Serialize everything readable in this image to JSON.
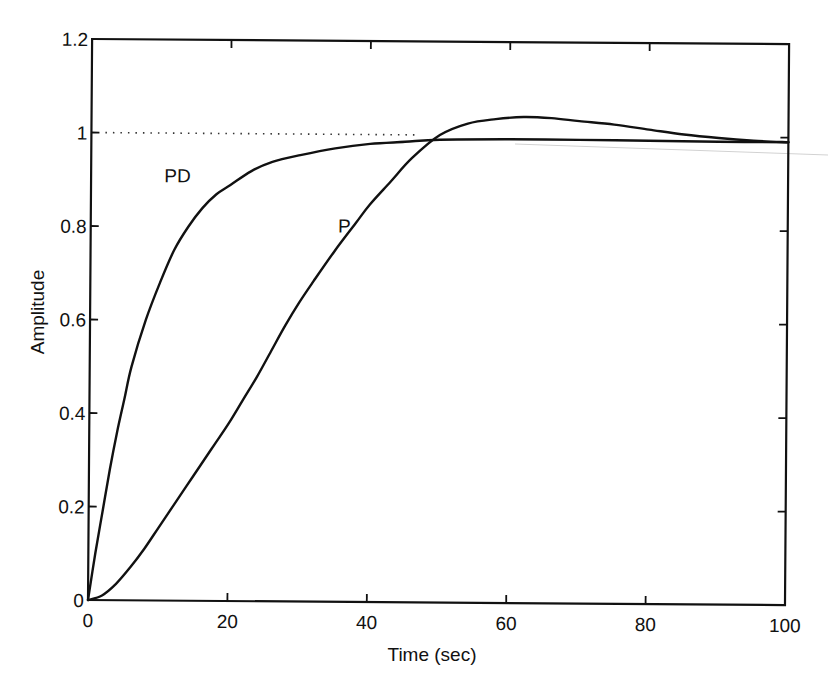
{
  "chart_data": {
    "type": "line",
    "title": "",
    "xlabel": "Time (sec)",
    "ylabel": "Amplitude",
    "xlim": [
      0,
      100
    ],
    "ylim": [
      0,
      1.2
    ],
    "xticks": [
      0,
      20,
      40,
      60,
      80,
      100
    ],
    "xtick_labels": [
      "0",
      "20",
      "40",
      "60",
      "80",
      "100"
    ],
    "yticks": [
      0,
      0.2,
      0.4,
      0.6,
      0.8,
      1,
      1.2
    ],
    "ytick_labels": [
      "0",
      "0.2",
      "0.4",
      "0.6",
      "0.8",
      "1",
      "1.2"
    ],
    "grid": false,
    "legend": null,
    "reference_line": {
      "y": 1.0,
      "style": "dotted",
      "x_range": [
        0,
        47
      ]
    },
    "annotations": [
      {
        "text": "PD",
        "x": 10.5,
        "y": 0.895
      },
      {
        "text": "P",
        "x": 35.5,
        "y": 0.79
      }
    ],
    "series": [
      {
        "name": "PD",
        "x": [
          0,
          1,
          2,
          3,
          4,
          5,
          6,
          8,
          10,
          12,
          14,
          16,
          18,
          20,
          23,
          26,
          30,
          35,
          40,
          45,
          50,
          60,
          70,
          80,
          90,
          100
        ],
        "y": [
          0,
          0.1,
          0.19,
          0.28,
          0.36,
          0.43,
          0.5,
          0.6,
          0.68,
          0.75,
          0.8,
          0.84,
          0.87,
          0.89,
          0.92,
          0.94,
          0.955,
          0.97,
          0.98,
          0.985,
          0.99,
          0.992,
          0.992,
          0.991,
          0.99,
          0.99
        ]
      },
      {
        "name": "P",
        "x": [
          0,
          2,
          4,
          6,
          8,
          10,
          12,
          14,
          16,
          18,
          20,
          22,
          24,
          26,
          28,
          30,
          32,
          35,
          38,
          40,
          43,
          46,
          50,
          54,
          58,
          62,
          66,
          70,
          75,
          80,
          85,
          90,
          95,
          100
        ],
        "y": [
          0,
          0.01,
          0.035,
          0.07,
          0.11,
          0.155,
          0.2,
          0.245,
          0.29,
          0.335,
          0.38,
          0.43,
          0.48,
          0.535,
          0.59,
          0.64,
          0.685,
          0.75,
          0.81,
          0.85,
          0.9,
          0.95,
          1.0,
          1.025,
          1.035,
          1.04,
          1.038,
          1.032,
          1.025,
          1.015,
          1.005,
          0.998,
          0.993,
          0.99
        ]
      }
    ],
    "artifacts": {
      "scan_line": {
        "x1": 515,
        "y1": 144,
        "x2": 828,
        "y2": 155,
        "color": "#cfcfcf"
      }
    }
  }
}
